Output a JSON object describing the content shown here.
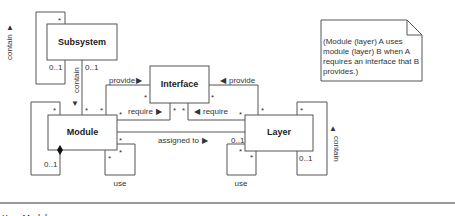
{
  "classes": {
    "subsystem": "Subsystem",
    "interface": "Interface",
    "module": "Module",
    "layer": "Layer"
  },
  "associations": {
    "subsystem_contain_self": {
      "label": "contain",
      "arrow": "▲",
      "mult_top": "*",
      "mult_bottom": "0..1"
    },
    "subsystem_contain_module": {
      "label": "contain",
      "arrow": "▼",
      "mult_subsystem": "0..1",
      "mult_module": "*"
    },
    "module_provide": {
      "label": "provide",
      "arrow": "▶",
      "mult_module": "*",
      "mult_interface": "*"
    },
    "module_require": {
      "label": "require",
      "arrow": "▶",
      "mult_module": "*",
      "mult_interface": "*"
    },
    "layer_provide": {
      "label": "provide",
      "arrow": "◀",
      "mult_interface": "*",
      "mult_layer": "*"
    },
    "layer_require": {
      "label": "require",
      "arrow": "◀",
      "mult_interface": "*",
      "mult_layer": "*"
    },
    "assigned_to": {
      "label": "assigned to",
      "arrow": "▶",
      "mult_module": "*",
      "mult_layer": "0..1"
    },
    "module_self": {
      "mult_top": "*",
      "mult_bottom": "0..1"
    },
    "module_use": {
      "label": "use",
      "mult_a": "*",
      "mult_b": "*"
    },
    "layer_use": {
      "label": "use",
      "mult_a": "*",
      "mult_b": "*"
    },
    "layer_contain": {
      "label": "contain",
      "arrow": "▲",
      "mult_top": "*",
      "mult_bottom": "0..1"
    }
  },
  "note": {
    "lines": [
      "(Module (layer) A uses",
      "module (layer) B when A",
      "requires an interface that B",
      "provides.)"
    ]
  },
  "key": {
    "text": "Key: Module"
  }
}
